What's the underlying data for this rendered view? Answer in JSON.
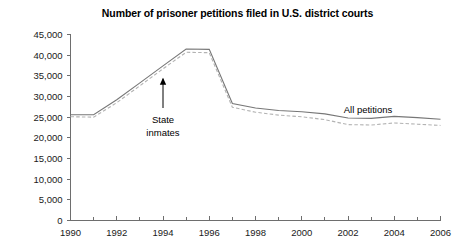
{
  "chart_data": {
    "type": "line",
    "title": "Number of prisoner petitions filed in U.S. district courts",
    "xlabel": "",
    "ylabel": "",
    "xlim": [
      1990,
      2006
    ],
    "ylim": [
      0,
      45000
    ],
    "grid": false,
    "legend_position": "inline-annotations",
    "x": [
      1990,
      1991,
      1992,
      1993,
      1994,
      1995,
      1996,
      1997,
      1998,
      1999,
      2000,
      2001,
      2002,
      2003,
      2004,
      2005,
      2006
    ],
    "xticks": [
      1990,
      1992,
      1994,
      1996,
      1998,
      2000,
      2002,
      2004,
      2006
    ],
    "xtick_labels": [
      "1990",
      "1992",
      "1994",
      "1996",
      "1998",
      "2000",
      "2002",
      "2004",
      "2006"
    ],
    "xminor_ticks": [
      1991,
      1993,
      1995,
      1997,
      1999,
      2001,
      2003,
      2005
    ],
    "yticks": [
      0,
      5000,
      10000,
      15000,
      20000,
      25000,
      30000,
      35000,
      40000,
      45000
    ],
    "ytick_labels": [
      "0",
      "5,000",
      "10,000",
      "15,000",
      "20,000",
      "25,000",
      "30,000",
      "35,000",
      "40,000",
      "45,000"
    ],
    "series": [
      {
        "name": "All petitions",
        "style": "solid",
        "color": "#777777",
        "values": [
          25600,
          25600,
          29200,
          33300,
          37400,
          41500,
          41400,
          28300,
          27200,
          26600,
          26300,
          25800,
          24800,
          24700,
          25200,
          24900,
          24500
        ]
      },
      {
        "name": "State inmates",
        "style": "dashed",
        "color": "#b3b3b3",
        "values": [
          25100,
          25000,
          28500,
          32600,
          36700,
          40700,
          40600,
          27400,
          26200,
          25500,
          25100,
          24400,
          23200,
          23100,
          23600,
          23300,
          23000
        ]
      }
    ],
    "annotations": [
      {
        "name": "state-inmates",
        "text_line1": "State",
        "text_line2": "inmates",
        "arrow_target_year": 1994,
        "arrow_target_value": 36700
      },
      {
        "name": "all-petitions",
        "text_line1": "All petitions",
        "text_line2": "",
        "arrow_target_year": null,
        "arrow_target_value": null
      }
    ]
  }
}
